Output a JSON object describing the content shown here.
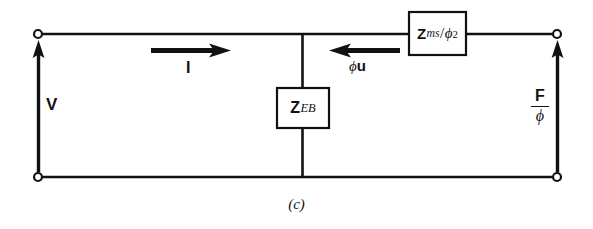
{
  "figure": {
    "caption": "(c)",
    "line_color": "#111111",
    "background_color": "#ffffff",
    "terminal_style": "open-circle"
  },
  "labels": {
    "source_voltage": "V",
    "current": "I",
    "velocity": {
      "phi": "ϕ",
      "u": "u"
    },
    "force_over_phi": {
      "numerator": "F",
      "denominator": "ϕ"
    }
  },
  "components": [
    {
      "name": "shunt-impedance",
      "symbol": "Z",
      "subscript": "EB",
      "orientation": "vertical",
      "label_text": "Z_EB"
    },
    {
      "name": "series-impedance",
      "symbol": "Z",
      "subscript": "ms",
      "denominator": "ϕ",
      "exponent": "2",
      "orientation": "horizontal",
      "label_text": "Z_ms/ϕ²"
    }
  ],
  "arrows": [
    {
      "name": "current-arrow",
      "direction": "right",
      "label": "I"
    },
    {
      "name": "velocity-arrow",
      "direction": "left",
      "label": "ϕu"
    },
    {
      "name": "voltage-arrow",
      "direction": "up",
      "label": "V"
    },
    {
      "name": "force-arrow",
      "direction": "up",
      "label": "F/ϕ"
    }
  ],
  "terminals": [
    {
      "name": "terminal-top-left",
      "x": 38,
      "y": 34
    },
    {
      "name": "terminal-bottom-left",
      "x": 38,
      "y": 177
    },
    {
      "name": "terminal-top-right",
      "x": 557,
      "y": 34
    },
    {
      "name": "terminal-bottom-right",
      "x": 557,
      "y": 177
    }
  ]
}
